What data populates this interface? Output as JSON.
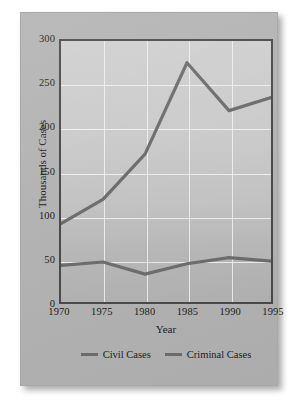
{
  "chart_data": {
    "type": "line",
    "title": "",
    "xlabel": "Year",
    "ylabel": "Thousands of Cases",
    "x": [
      1970,
      1975,
      1980,
      1985,
      1990,
      1995
    ],
    "xticklabels": [
      "1970",
      "1975",
      "1980",
      "1985",
      "1990",
      "1995"
    ],
    "yticklabels": [
      "0",
      "50",
      "100",
      "150",
      "200",
      "250",
      "300"
    ],
    "yticks": [
      0,
      50,
      100,
      150,
      200,
      250,
      300
    ],
    "xlim": [
      1970,
      1995
    ],
    "ylim": [
      0,
      300
    ],
    "grid": true,
    "legend_position": "bottom",
    "series": [
      {
        "name": "Civil Cases",
        "color": "#6e6e6e",
        "values": [
          90,
          118,
          170,
          275,
          220,
          235
        ]
      },
      {
        "name": "Criminal Cases",
        "color": "#6e6e6e",
        "values": [
          42,
          46,
          32,
          44,
          51,
          47
        ]
      }
    ]
  },
  "legend": {
    "items": [
      {
        "label": "Civil Cases"
      },
      {
        "label": "Criminal Cases"
      }
    ]
  },
  "colors": {
    "card_background": "#b3b3b3",
    "plot_background": "#c9c9c9",
    "line": "#6e6e6e",
    "gridline": "#f0f0f0",
    "axis": "#4a4a4a",
    "text": "#1c1c1c"
  }
}
